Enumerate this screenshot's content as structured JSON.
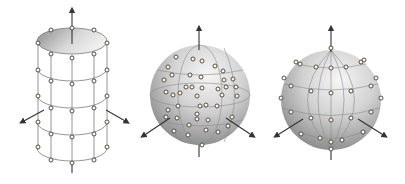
{
  "figure": {
    "panels": [
      {
        "id": "cylinder",
        "label": "cylindrical-grid-sampling",
        "shape": "cylinder",
        "center_x": 72,
        "top_y": 41,
        "rx": 35,
        "ry": 13,
        "ring_y": [
          41,
          68,
          95,
          122,
          148
        ],
        "points_front_cols": [
          51,
          72,
          94
        ],
        "points_side_cols": [
          38,
          107
        ]
      },
      {
        "id": "sphere-random",
        "label": "random-sphere-sampling",
        "shape": "sphere",
        "cx": 200,
        "cy": 95,
        "r": 50,
        "points": [
          [
            176,
            57
          ],
          [
            193,
            59
          ],
          [
            202,
            61
          ],
          [
            168,
            67
          ],
          [
            215,
            66
          ],
          [
            223,
            71
          ],
          [
            172,
            75
          ],
          [
            190,
            75
          ],
          [
            201,
            77
          ],
          [
            164,
            80
          ],
          [
            224,
            80
          ],
          [
            233,
            79
          ],
          [
            186,
            87
          ],
          [
            192,
            87
          ],
          [
            202,
            88
          ],
          [
            218,
            89
          ],
          [
            226,
            87
          ],
          [
            236,
            87
          ],
          [
            166,
            92
          ],
          [
            173,
            95
          ],
          [
            180,
            93
          ],
          [
            197,
            96
          ],
          [
            222,
            95
          ],
          [
            237,
            96
          ],
          [
            178,
            106
          ],
          [
            200,
            106
          ],
          [
            206,
            105
          ],
          [
            217,
            106
          ],
          [
            168,
            110
          ],
          [
            197,
            114
          ],
          [
            166,
            117
          ],
          [
            177,
            118
          ],
          [
            197,
            119
          ],
          [
            208,
            120
          ],
          [
            232,
            117
          ],
          [
            189,
            125
          ],
          [
            174,
            131
          ],
          [
            206,
            130
          ],
          [
            218,
            132
          ],
          [
            188,
            135
          ],
          [
            202,
            145
          ],
          [
            228,
            126
          ]
        ]
      },
      {
        "id": "sphere-uniform",
        "label": "uniform-sphere-sampling",
        "shape": "sphere",
        "cx": 331,
        "cy": 100,
        "r": 50,
        "points": [
          [
            331,
            48
          ],
          [
            296,
            62
          ],
          [
            300,
            64
          ],
          [
            316,
            67
          ],
          [
            331,
            68
          ],
          [
            346,
            67
          ],
          [
            361,
            62
          ],
          [
            364,
            60
          ],
          [
            284,
            78
          ],
          [
            291,
            86
          ],
          [
            311,
            91
          ],
          [
            331,
            93
          ],
          [
            351,
            91
          ],
          [
            371,
            86
          ],
          [
            376,
            78
          ],
          [
            281,
            98
          ],
          [
            381,
            98
          ],
          [
            291,
            112
          ],
          [
            311,
            118
          ],
          [
            331,
            120
          ],
          [
            351,
            118
          ],
          [
            371,
            112
          ],
          [
            301,
            134
          ],
          [
            320,
            138
          ],
          [
            331,
            142
          ],
          [
            342,
            140
          ],
          [
            363,
            132
          ],
          [
            331,
            149
          ]
        ]
      }
    ],
    "colors": {
      "shade_light": "#f4f4f4",
      "shade_dark": "#8a8a8a",
      "line": "#7a7a7a",
      "arrow": "#333333",
      "point_stroke": "#5a4a3a",
      "point_fill": "#ffffff"
    }
  }
}
